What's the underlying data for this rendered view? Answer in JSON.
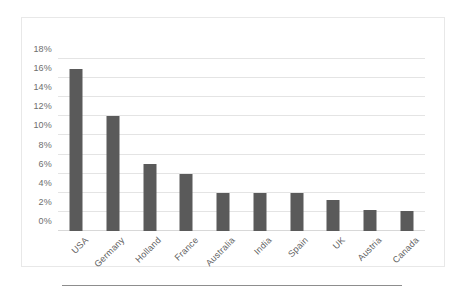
{
  "chart_data": {
    "type": "bar",
    "title": "",
    "subtitle": "",
    "xlabel": "",
    "ylabel": "",
    "categories": [
      "USA",
      "Germany",
      "Holland",
      "France",
      "Australia",
      "India",
      "Spain",
      "UK",
      "Austria",
      "Canada"
    ],
    "values": [
      17,
      12,
      7,
      6,
      4,
      4,
      4,
      3.2,
      2.2,
      2.1
    ],
    "value_labels": [
      "17%",
      "12%",
      "7%",
      "6%",
      "4%",
      "4%",
      "4%",
      "3.2%",
      "2.2%",
      "2.1%"
    ],
    "ylim": [
      0,
      18
    ],
    "ytick_values": [
      0,
      2,
      4,
      6,
      8,
      10,
      12,
      14,
      16,
      18
    ],
    "ytick_labels": [
      "0%",
      "2%",
      "4%",
      "6%",
      "8%",
      "10%",
      "12%",
      "14%",
      "16%",
      "18%"
    ],
    "grid": true,
    "legend": false,
    "legend_position": "none",
    "bar_color": "#5a5a5a",
    "gridline_color": "#e4e4e4",
    "axis_label_color": "#6e6e6e",
    "plot_background": "#ffffff",
    "border_color": "#e8e8e8",
    "xtick_rotation_degrees": -45
  },
  "figure": {
    "rule_color": "#8d8d8d"
  }
}
